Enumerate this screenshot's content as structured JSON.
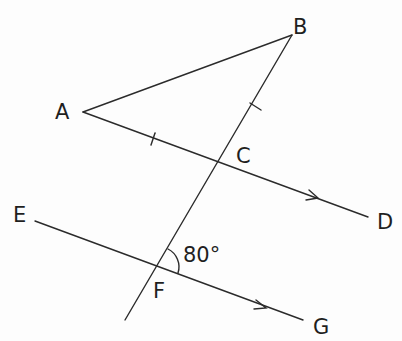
{
  "diagram": {
    "type": "geometry",
    "points": {
      "A": {
        "label": "A",
        "x": 83,
        "y": 112,
        "label_x": 55,
        "label_y": 119
      },
      "B": {
        "label": "B",
        "x": 292,
        "y": 35,
        "label_x": 293,
        "label_y": 34
      },
      "C": {
        "label": "C",
        "x": 218,
        "y": 165,
        "label_x": 236,
        "label_y": 163
      },
      "D": {
        "label": "D",
        "x": 368,
        "y": 217,
        "label_x": 377,
        "label_y": 229
      },
      "E": {
        "label": "E",
        "x": 35,
        "y": 221,
        "label_x": 13,
        "label_y": 222
      },
      "F": {
        "label": "F",
        "x": 155,
        "y": 266,
        "label_x": 153,
        "label_y": 298
      },
      "G": {
        "label": "G",
        "x": 303,
        "y": 320,
        "label_x": 313,
        "label_y": 334
      }
    },
    "segments": [
      {
        "from": "A",
        "to": "B"
      },
      {
        "from": "A",
        "to": "D",
        "through": "C",
        "arrow": true
      },
      {
        "from": "E",
        "to": "G",
        "through": "F",
        "arrow": true
      },
      {
        "from": "B",
        "to": "end",
        "through": [
          "C",
          "F"
        ],
        "end": {
          "x": 125,
          "y": 320
        }
      }
    ],
    "tick_marks": [
      {
        "segment": "AC",
        "count": 1
      },
      {
        "segment": "BC",
        "count": 1
      }
    ],
    "parallel_marks": [
      "CD",
      "FG"
    ],
    "angle": {
      "vertex": "F",
      "value": "80°",
      "between": [
        "FB",
        "FG"
      ]
    }
  }
}
